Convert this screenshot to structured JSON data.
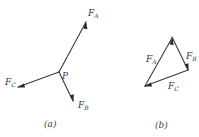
{
  "diagram": {
    "panel_a": {
      "caption": "(a)",
      "point_label": "P",
      "forces": [
        {
          "name": "F",
          "subscript": "A"
        },
        {
          "name": "F",
          "subscript": "B"
        },
        {
          "name": "F",
          "subscript": "C"
        }
      ]
    },
    "panel_b": {
      "caption": "(b)",
      "forces": [
        {
          "name": "F",
          "subscript": "A"
        },
        {
          "name": "F",
          "subscript": "B"
        },
        {
          "name": "F",
          "subscript": "C"
        }
      ]
    },
    "colors": {
      "ink": "#3a3a3a",
      "background": "#ffffff"
    }
  }
}
